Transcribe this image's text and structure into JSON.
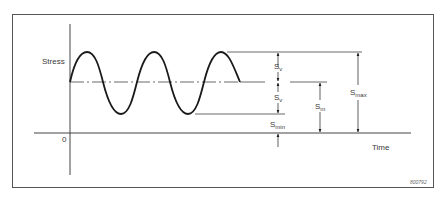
{
  "diagram": {
    "figure_code": "800792",
    "axes": {
      "y_label": "Stress",
      "x_label": "Time",
      "origin_label": "0"
    },
    "annotations": {
      "sv_upper": {
        "main": "S",
        "sub": "v"
      },
      "sv_lower": {
        "main": "S",
        "sub": "v"
      },
      "s_min": {
        "main": "S",
        "sub": "min"
      },
      "s_m": {
        "main": "S",
        "sub": "m"
      },
      "s_max": {
        "main": "S",
        "sub": "max"
      }
    },
    "wave": {
      "type": "sinusoid",
      "cycles": 2.5,
      "mean_level_label": "S_m",
      "amplitude_label": "S_v"
    },
    "colors": {
      "line": "#1a1a1a",
      "thin_line": "#444444",
      "frame": "#555555",
      "background": "#ffffff"
    }
  }
}
